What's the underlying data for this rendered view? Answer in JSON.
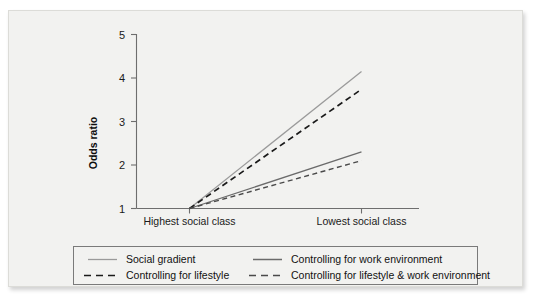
{
  "figure": {
    "background_color": "#f2f2f0",
    "axis_color": "#6e6e6e"
  },
  "chart_data": {
    "type": "line",
    "title": "",
    "subtitle": "",
    "xlabel": "",
    "ylabel": "Odds ratio",
    "categories": [
      "Highest social class",
      "Lowest social class"
    ],
    "x": [
      0,
      1
    ],
    "ylim": [
      1,
      5
    ],
    "yticks": [
      1,
      2,
      3,
      4,
      5
    ],
    "ytick_labels": [
      "1",
      "2",
      "3",
      "4",
      "5"
    ],
    "grid": false,
    "legend_position": "bottom",
    "series": [
      {
        "name": "Social gradient",
        "values": [
          1.0,
          4.15
        ],
        "style": "solid",
        "color": "#9a9a9a"
      },
      {
        "name": "Controlling for lifestyle",
        "values": [
          1.0,
          3.74
        ],
        "style": "dashed",
        "color": "#1a1a1a"
      },
      {
        "name": "Controlling for work environment",
        "values": [
          1.0,
          2.3
        ],
        "style": "solid",
        "color": "#6b6b6b"
      },
      {
        "name": "Controlling for lifestyle & work environment",
        "values": [
          1.0,
          2.1
        ],
        "style": "dashed",
        "color": "#4a4a4a"
      }
    ]
  },
  "axis": {
    "y_title": "Odds ratio",
    "y_ticks": [
      "5",
      "4",
      "3",
      "2",
      "1"
    ],
    "x_categories": [
      "Highest social class",
      "Lowest social class"
    ]
  },
  "legend": {
    "entries": [
      {
        "label": "Social gradient",
        "style": "solid",
        "color": "#9a9a9a"
      },
      {
        "label": "Controlling for work environment",
        "style": "solid",
        "color": "#6b6b6b"
      },
      {
        "label": "Controlling for lifestyle",
        "style": "dashed",
        "color": "#1a1a1a"
      },
      {
        "label": "Controlling for lifestyle & work environment",
        "style": "dashed",
        "color": "#4a4a4a"
      }
    ]
  }
}
